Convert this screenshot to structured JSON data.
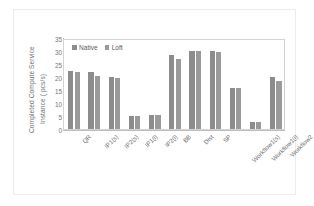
{
  "chart_data": {
    "type": "bar",
    "title": "",
    "xlabel": "",
    "ylabel": "Completed Compute Service Instance ( pcs/s)",
    "ylabel_lines": [
      "Completed Compute Service",
      "Instance  ( pcs/s)"
    ],
    "ylim": [
      0,
      35
    ],
    "yticks": [
      35,
      30,
      25,
      20,
      15,
      10,
      5,
      0
    ],
    "grid": false,
    "legend_position": "top-left",
    "categories": [
      "QR",
      "IP1(s)",
      "IP2(s)",
      "IP1(l)",
      "IP2(l)",
      "BB",
      "Dist",
      "SP",
      "Workflow1(s)",
      "Workflow1(l)",
      "Workflow2"
    ],
    "series": [
      {
        "name": "Native",
        "color": "#8c8c8c",
        "values": [
          23.0,
          22.3,
          20.5,
          5.3,
          5.5,
          29.2,
          30.5,
          30.8,
          16.2,
          2.6,
          20.3
        ]
      },
      {
        "name": "Loft",
        "color": "#9a9a9a",
        "values": [
          22.5,
          21.0,
          20.2,
          5.3,
          5.5,
          27.7,
          30.5,
          30.2,
          16.0,
          2.6,
          19.0
        ]
      }
    ]
  },
  "legend": {
    "items": [
      {
        "label": "Native",
        "color": "#8c8c8c"
      },
      {
        "label": "Loft",
        "color": "#9a9a9a"
      }
    ]
  },
  "colors": {
    "native": "#8c8c8c",
    "loft": "#9a9a9a",
    "axis": "#bdbdbd",
    "text": "#6b6b6b",
    "frame": "#ececec",
    "background": "#ffffff"
  }
}
